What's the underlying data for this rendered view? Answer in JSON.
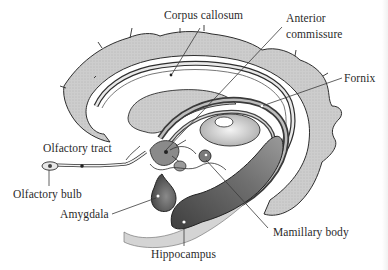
{
  "diagram": {
    "colors": {
      "cortex_fill": "#c9c9c9",
      "outline": "#2e2e2e",
      "dark_structure": "#5a5a5a",
      "light_fill": "#ececec",
      "background": "#ffffff"
    },
    "labels": [
      {
        "id": "corpus-callosum",
        "text": "Corpus callosum"
      },
      {
        "id": "anterior-commissure",
        "text": "Anterior\ncommissure",
        "line1": "Anterior",
        "line2": "commissure"
      },
      {
        "id": "fornix",
        "text": "Fornix"
      },
      {
        "id": "olfactory-tract",
        "text": "Olfactory tract"
      },
      {
        "id": "olfactory-bulb",
        "text": "Olfactory bulb"
      },
      {
        "id": "amygdala",
        "text": "Amygdala"
      },
      {
        "id": "mamillary-body",
        "text": "Mamillary body"
      },
      {
        "id": "hippocampus",
        "text": "Hippocampus"
      }
    ]
  }
}
